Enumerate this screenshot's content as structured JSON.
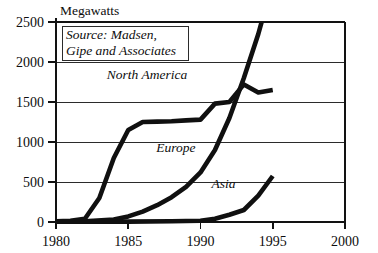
{
  "chart_data": {
    "type": "line",
    "title": "",
    "ylabel": "Megawatts",
    "xlabel": "",
    "xlim": [
      1980,
      2000
    ],
    "ylim": [
      0,
      2500
    ],
    "grid": true,
    "legend_position": "inline-labels",
    "xticks": [
      "1980",
      "1985",
      "1990",
      "1995",
      "2000"
    ],
    "xtick_values": [
      1980,
      1985,
      1990,
      1995,
      2000
    ],
    "yticks": [
      "0",
      "500",
      "1000",
      "1500",
      "2000",
      "2500"
    ],
    "ytick_values": [
      0,
      500,
      1000,
      1500,
      2000,
      2500
    ],
    "annotations": [
      {
        "name": "source-note",
        "text_line_1": "Source: Madsen,",
        "text_line_2": "Gipe and Associates"
      }
    ],
    "series": [
      {
        "name": "North America",
        "label": "North America",
        "label_x": 1986.3,
        "label_y": 1790,
        "color": "#101010",
        "x": [
          1980,
          1981,
          1982,
          1983,
          1984,
          1985,
          1986,
          1987,
          1988,
          1989,
          1990,
          1991,
          1992,
          1993,
          1994,
          1995
        ],
        "values": [
          10,
          15,
          40,
          300,
          800,
          1150,
          1250,
          1255,
          1260,
          1270,
          1280,
          1480,
          1500,
          1720,
          1620,
          1650
        ]
      },
      {
        "name": "Europe",
        "label": "Europe",
        "label_x": 1988.3,
        "label_y": 880,
        "color": "#101010",
        "x": [
          1980,
          1982,
          1984,
          1985,
          1986,
          1987,
          1988,
          1989,
          1990,
          1991,
          1992,
          1993,
          1994,
          1995
        ],
        "values": [
          5,
          10,
          30,
          70,
          130,
          210,
          310,
          440,
          620,
          900,
          1300,
          1800,
          2350,
          3000
        ]
      },
      {
        "name": "Asia",
        "label": "Asia",
        "label_x": 1991.6,
        "label_y": 420,
        "color": "#101010",
        "x": [
          1980,
          1985,
          1988,
          1990,
          1991,
          1992,
          1993,
          1994,
          1995
        ],
        "values": [
          0,
          5,
          10,
          15,
          40,
          90,
          150,
          330,
          575
        ]
      }
    ]
  },
  "colors": {
    "ink": "#101010",
    "grid": "#2b2b2b",
    "background": "#ffffff"
  }
}
